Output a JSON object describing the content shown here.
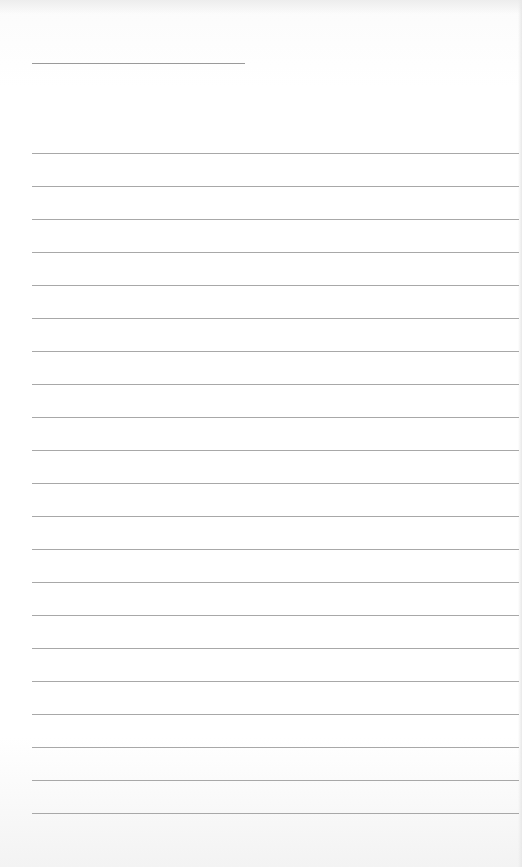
{
  "page": {
    "type": "lined-paper",
    "background_color": "#ffffff",
    "rule_color": "#a8a8a8",
    "title_line": {
      "x": 32,
      "y": 63,
      "width": 213
    },
    "rules": {
      "count": 21,
      "first_y": 153,
      "spacing": 33,
      "left_x": 32
    }
  }
}
